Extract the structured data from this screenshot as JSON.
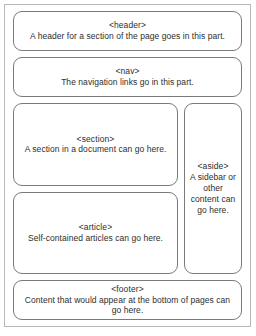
{
  "diagram": {
    "border_color": "#7a7a7a",
    "frame_color": "#b9b9b9",
    "text_color": "#2e2e2e",
    "background": "#ffffff",
    "regions": {
      "header": {
        "tag": "<header>",
        "description": "A header for a section of the page goes in this part."
      },
      "nav": {
        "tag": "<nav>",
        "description": "The navigation links go in this part."
      },
      "section": {
        "tag": "<section>",
        "description": "A section in a document can go here."
      },
      "article": {
        "tag": "<article>",
        "description": "Self-contained articles can go here."
      },
      "aside": {
        "tag": "<aside>",
        "description": "A sidebar or other content can go here."
      },
      "footer": {
        "tag": "<footer>",
        "description": "Content that would appear at the bottom of pages can go here."
      }
    }
  }
}
